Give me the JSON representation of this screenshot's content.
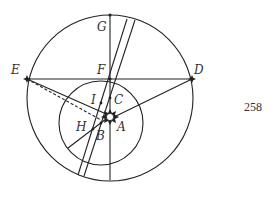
{
  "figure": {
    "page_number": "258",
    "labels": {
      "A": "A",
      "B": "B",
      "C": "C",
      "D": "D",
      "E": "E",
      "F": "F",
      "G": "G",
      "H": "H",
      "I": "I"
    },
    "colors": {
      "stroke": "#222222",
      "label": "#333333",
      "background": "#ffffff"
    }
  }
}
